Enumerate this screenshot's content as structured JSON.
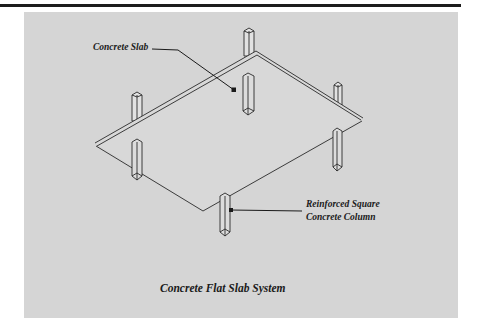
{
  "figure": {
    "title": "Concrete Flat Slab System",
    "labels": {
      "slab": "Concrete Slab",
      "column_line1": "Reinforced Square",
      "column_line2": "Concrete Column"
    },
    "colors": {
      "panel": "#d5d5d5",
      "ink": "#1a1a1a",
      "rule": "#1c1c1c"
    }
  }
}
